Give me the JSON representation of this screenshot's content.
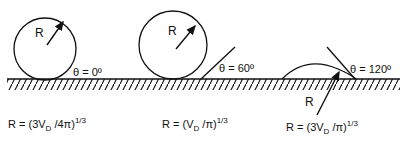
{
  "diagram": {
    "title": "",
    "panels": [
      {
        "id": "theta-0",
        "radius_label": "R",
        "angle_label": "θ = 0º",
        "formula": {
          "prefix": "R = (3V",
          "sub": "D",
          "mid": " /4π)",
          "sup": "1/3"
        }
      },
      {
        "id": "theta-60",
        "radius_label": "R",
        "angle_label": "θ = 60º",
        "formula": {
          "prefix": "R = (V",
          "sub": "D",
          "mid": " /π)",
          "sup": "1/3"
        }
      },
      {
        "id": "theta-120",
        "radius_label": "R",
        "angle_label": "θ = 120º",
        "formula": {
          "prefix": "R = (3V",
          "sub": "D",
          "mid": " /π)",
          "sup": "1/3"
        }
      }
    ],
    "colors": {
      "stroke": "#111111",
      "background": "#ffffff"
    }
  }
}
